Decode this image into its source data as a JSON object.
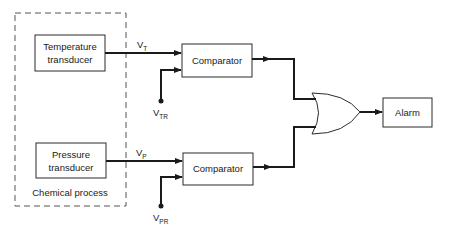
{
  "diagram": {
    "enclosure": {
      "label": "Chemical process"
    },
    "blocks": {
      "temperature_transducer": {
        "line1": "Temperature",
        "line2": "transducer"
      },
      "pressure_transducer": {
        "line1": "Pressure",
        "line2": "transducer"
      },
      "comparator_top": {
        "label": "Comparator"
      },
      "comparator_bottom": {
        "label": "Comparator"
      },
      "alarm": {
        "label": "Alarm"
      }
    },
    "gate": {
      "type": "OR"
    },
    "signals": {
      "vt": {
        "main": "V",
        "sub": "T"
      },
      "vtr": {
        "main": "V",
        "sub": "TR"
      },
      "vp": {
        "main": "V",
        "sub": "P"
      },
      "vpr": {
        "main": "V",
        "sub": "PR"
      }
    },
    "colors": {
      "line": "#1a1a1a",
      "background": "#ffffff"
    }
  }
}
